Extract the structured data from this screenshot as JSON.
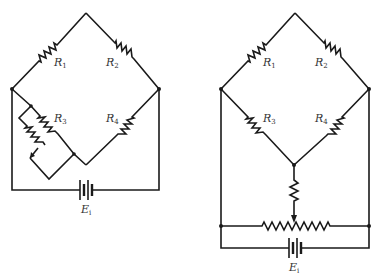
{
  "figure": {
    "left_circuit": {
      "name": "Wheatstone bridge with shunt adjustment on R3",
      "labels": {
        "r1": {
          "main": "R",
          "sub": "1"
        },
        "r2": {
          "main": "R",
          "sub": "2"
        },
        "r3": {
          "main": "R",
          "sub": "3"
        },
        "r4": {
          "main": "R",
          "sub": "4"
        },
        "source": {
          "main": "E",
          "sub": "i"
        }
      }
    },
    "right_circuit": {
      "name": "Wheatstone bridge with slide-wire potentiometer balance",
      "labels": {
        "r1": {
          "main": "R",
          "sub": "1"
        },
        "r2": {
          "main": "R",
          "sub": "2"
        },
        "r3": {
          "main": "R",
          "sub": "3"
        },
        "r4": {
          "main": "R",
          "sub": "4"
        },
        "source": {
          "main": "E",
          "sub": "i"
        }
      }
    },
    "colors": {
      "ink": "#1a1a1a",
      "label": "#333333",
      "background": "#ffffff"
    }
  }
}
